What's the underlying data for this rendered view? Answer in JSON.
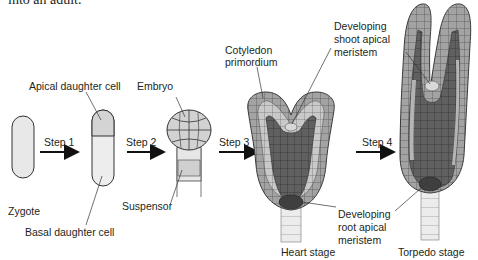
{
  "intro_text": "into an adult.",
  "stages": {
    "zygote": "Zygote",
    "heart": "Heart stage",
    "torpedo": "Torpedo stage"
  },
  "labels": {
    "apical_daughter_cell": "Apical daughter cell",
    "basal_daughter_cell": "Basal daughter cell",
    "embryo": "Embryo",
    "suspensor": "Suspensor",
    "cotyledon_primordium_1": "Cotyledon",
    "cotyledon_primordium_2": "primordium",
    "shoot_meristem_1": "Developing",
    "shoot_meristem_2": "shoot apical",
    "shoot_meristem_3": "meristem",
    "root_meristem_1": "Developing",
    "root_meristem_2": "root apical",
    "root_meristem_3": "meristem"
  },
  "steps": [
    {
      "label": "Step 1"
    },
    {
      "label": "Step 2"
    },
    {
      "label": "Step 3"
    },
    {
      "label": "Step 4"
    }
  ],
  "colors": {
    "light_cell": "#e6e6e6",
    "mid_cell": "#a8a8a8",
    "dark_cell": "#6b6b6b",
    "darkest_cell": "#505050",
    "outline": "#3a3a3a"
  }
}
